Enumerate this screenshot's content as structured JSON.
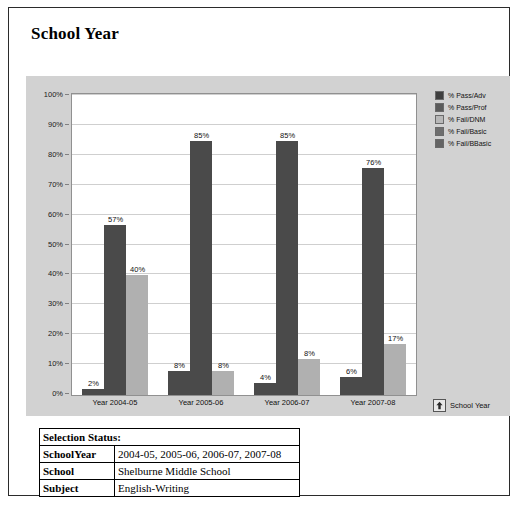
{
  "report": {
    "title": "School Year"
  },
  "chart_data": {
    "type": "bar",
    "title": "School Year",
    "xlabel": "",
    "ylabel": "",
    "ylim": [
      0,
      100
    ],
    "ytick_labels": [
      "0%",
      "10%",
      "20%",
      "30%",
      "40%",
      "50%",
      "60%",
      "70%",
      "80%",
      "90%",
      "100%"
    ],
    "ytick_values": [
      0,
      10,
      20,
      30,
      40,
      50,
      60,
      70,
      80,
      90,
      100
    ],
    "grid": true,
    "legend_position": "right",
    "categories": [
      "Year 2004-05",
      "Year 2005-06",
      "Year 2006-07",
      "Year 2007-08"
    ],
    "series": [
      {
        "name": "% Pass/Adv",
        "color": "#4a4a4a",
        "values": [
          2,
          8,
          4,
          6
        ],
        "labels": [
          "2%",
          "8%",
          "4%",
          "6%"
        ]
      },
      {
        "name": "% Pass/Prof",
        "color": "#4a4a4a",
        "values": [
          57,
          85,
          85,
          76
        ],
        "labels": [
          "57%",
          "85%",
          "85%",
          "76%"
        ]
      },
      {
        "name": "% Fail/DNM",
        "color": "#b0b0b0",
        "values": [
          40,
          8,
          12,
          17
        ],
        "labels": [
          "40%",
          "8%",
          "8%",
          "17%"
        ]
      }
    ],
    "legend": [
      {
        "label": "% Pass/Adv",
        "color": "#3f3f3f"
      },
      {
        "label": "% Pass/Prof",
        "color": "#5a5a5a"
      },
      {
        "label": "% Fail/DNM",
        "color": "#b8b8b8"
      },
      {
        "label": "% Fail/Basic",
        "color": "#6e6e6e"
      },
      {
        "label": "% Fail/BBasic",
        "color": "#646464"
      }
    ]
  },
  "drillup": {
    "label": "School Year",
    "icon": "up-arrow-icon"
  },
  "selection_status": {
    "header": "Selection Status:",
    "rows": [
      {
        "key": "SchoolYear",
        "value": "2004-05, 2005-06, 2006-07, 2007-08"
      },
      {
        "key": "School",
        "value": "Shelburne Middle School"
      },
      {
        "key": "Subject",
        "value": "English-Writing"
      }
    ]
  }
}
